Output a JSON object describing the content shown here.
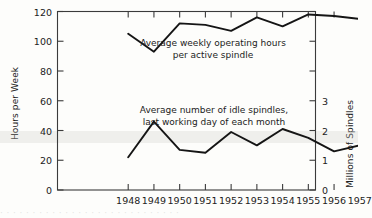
{
  "chart_data": {
    "type": "line",
    "title": "",
    "xlabel": "",
    "ylabel": "Hours per Week",
    "y2label": "Millions of Spindles",
    "grid": false,
    "legend_position": "inline-annotations",
    "x": [
      1948,
      1949,
      1950,
      1951,
      1952,
      1953,
      1954,
      1955,
      1956,
      1957
    ],
    "xtick_labels": [
      "1948",
      "1949",
      "1950",
      "1951",
      "1952",
      "1953",
      "1954",
      "1955",
      "1956",
      "1957"
    ],
    "ylim": [
      0,
      120
    ],
    "ytick_labels": [
      "0",
      "20",
      "40",
      "60",
      "80",
      "100",
      "120"
    ],
    "ytick_values": [
      0,
      20,
      40,
      60,
      80,
      100,
      120
    ],
    "y2lim": [
      0,
      6
    ],
    "y2tick_labels": [
      "0",
      "1",
      "2",
      "3"
    ],
    "y2tick_values": [
      0,
      1,
      2,
      3
    ],
    "y2_minor_values": [
      4,
      5,
      6
    ],
    "series": [
      {
        "name": "Average weekly operating hours per active spindle",
        "axis": "left",
        "unit": "hours per week",
        "values": [
          105,
          93,
          112,
          111,
          107,
          116,
          110,
          118,
          117,
          115
        ]
      },
      {
        "name": "Average number of idle spindles, last working day of each month",
        "axis": "right",
        "unit": "millions of spindles",
        "values": [
          1.1,
          2.3,
          1.35,
          1.25,
          1.95,
          1.5,
          2.05,
          1.75,
          1.3,
          1.5
        ]
      }
    ],
    "annotations": [
      {
        "id": "upper",
        "line1": "Average weekly operating hours",
        "line2": "per active spindle"
      },
      {
        "id": "lower",
        "line1": "Average number of idle spindles,",
        "line2": "last working day of each month"
      }
    ]
  },
  "axes": {
    "left_title": "Hours per Week",
    "right_title": "Millions of Spindles"
  },
  "bleed": {
    "text": "· · · · · · · · · · · · · · · · · · · · · · · · · · · ·"
  }
}
